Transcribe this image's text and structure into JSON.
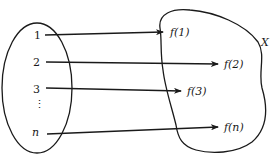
{
  "diagram": {
    "type": "function-mapping",
    "domain_set": {
      "elements": [
        "1",
        "2",
        "3",
        "⋮",
        "n"
      ]
    },
    "codomain_set": {
      "label": "X",
      "images": [
        "f(1)",
        "f(2)",
        "f(3)",
        "f(n)"
      ]
    },
    "mappings": [
      {
        "from": "1",
        "to": "f(1)"
      },
      {
        "from": "2",
        "to": "f(2)"
      },
      {
        "from": "3",
        "to": "f(3)"
      },
      {
        "from": "n",
        "to": "f(n)"
      }
    ],
    "colors": {
      "ink": "#1a1a1a",
      "background": "#ffffff"
    }
  }
}
